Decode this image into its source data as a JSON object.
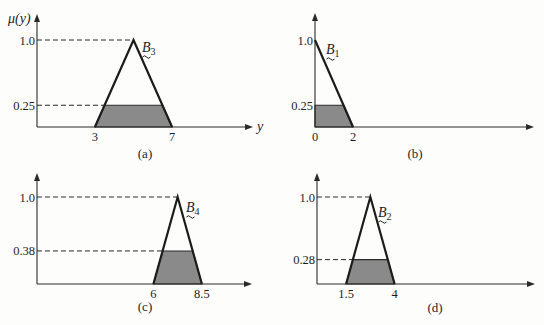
{
  "figure": {
    "title": "",
    "panels": [
      {
        "id": "a",
        "caption": "(a)",
        "set_label": "B",
        "set_index": "3",
        "y_axis_label": "μ(y)",
        "x_axis_label": "y",
        "y_ticks": [
          "1.0",
          "0.25"
        ],
        "x_ticks": [
          "3",
          "7"
        ]
      },
      {
        "id": "b",
        "caption": "(b)",
        "set_label": "B",
        "set_index": "1",
        "y_axis_label": "",
        "x_axis_label": "",
        "y_ticks": [
          "1.0",
          "0.25"
        ],
        "x_ticks": [
          "0",
          "2"
        ]
      },
      {
        "id": "c",
        "caption": "(c)",
        "set_label": "B",
        "set_index": "4",
        "y_axis_label": "",
        "x_axis_label": "",
        "y_ticks": [
          "1.0",
          "0.38"
        ],
        "x_ticks": [
          "6",
          "8.5"
        ]
      },
      {
        "id": "d",
        "caption": "(d)",
        "set_label": "B",
        "set_index": "2",
        "y_axis_label": "",
        "x_axis_label": "",
        "y_ticks": [
          "1.0",
          "0.28"
        ],
        "x_ticks": [
          "1.5",
          "4"
        ]
      }
    ],
    "colors": {
      "line": "#1c1c1c",
      "shade": "#8a8a8a",
      "background": "#fdfdfc"
    }
  },
  "chart_data": [
    {
      "id": "a",
      "type": "area",
      "title": "(a)",
      "xlabel": "y",
      "ylabel": "μ(y)",
      "membership": {
        "name": "B3",
        "shape": "triangle",
        "left": 3,
        "peak": 5,
        "right": 7
      },
      "clip_level": 0.25,
      "shaded_region": [
        [
          3,
          0
        ],
        [
          3.5,
          0.25
        ],
        [
          6.5,
          0.25
        ],
        [
          7,
          0
        ]
      ],
      "y_ticks": [
        1.0,
        0.25
      ],
      "x_ticks": [
        3,
        7
      ],
      "ylim": [
        0,
        1.0
      ],
      "grid": false
    },
    {
      "id": "b",
      "type": "area",
      "title": "(b)",
      "xlabel": "",
      "ylabel": "",
      "membership": {
        "name": "B1",
        "shape": "right-triangle",
        "left": 0,
        "peak": 0,
        "right": 2
      },
      "clip_level": 0.25,
      "shaded_region": [
        [
          0,
          0
        ],
        [
          0,
          0.25
        ],
        [
          1.5,
          0.25
        ],
        [
          2,
          0
        ]
      ],
      "y_ticks": [
        1.0,
        0.25
      ],
      "x_ticks": [
        0,
        2
      ],
      "ylim": [
        0,
        1.0
      ],
      "grid": false
    },
    {
      "id": "c",
      "type": "area",
      "title": "(c)",
      "xlabel": "",
      "ylabel": "",
      "membership": {
        "name": "B4",
        "shape": "triangle",
        "left": 6,
        "peak": 7.25,
        "right": 8.5
      },
      "clip_level": 0.38,
      "shaded_region": [
        [
          6,
          0
        ],
        [
          6.475,
          0.38
        ],
        [
          8.025,
          0.38
        ],
        [
          8.5,
          0
        ]
      ],
      "y_ticks": [
        1.0,
        0.38
      ],
      "x_ticks": [
        6,
        8.5
      ],
      "ylim": [
        0,
        1.0
      ],
      "grid": false
    },
    {
      "id": "d",
      "type": "area",
      "title": "(d)",
      "xlabel": "",
      "ylabel": "",
      "membership": {
        "name": "B2",
        "shape": "triangle",
        "left": 1.5,
        "peak": 2.75,
        "right": 4
      },
      "clip_level": 0.28,
      "shaded_region": [
        [
          1.5,
          0
        ],
        [
          1.85,
          0.28
        ],
        [
          3.65,
          0.28
        ],
        [
          4,
          0
        ]
      ],
      "y_ticks": [
        1.0,
        0.28
      ],
      "x_ticks": [
        1.5,
        4
      ],
      "ylim": [
        0,
        1.0
      ],
      "grid": false
    }
  ]
}
